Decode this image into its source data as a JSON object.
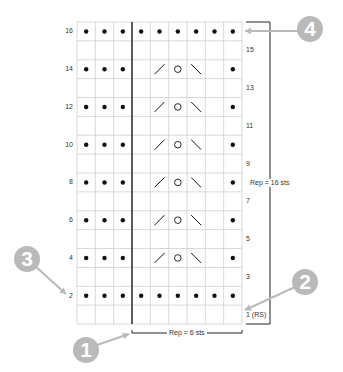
{
  "chart": {
    "columns": 9,
    "rows": 16,
    "grid_color": "#c8c8c8",
    "symbol_color": "#111111",
    "callout_color": "#b9b9b9",
    "row_pattern_key": {
      "P": "purl (dot)",
      "K": "knit (blank)",
      "/": "k2tog",
      "O": "yarn over",
      "\\": "ssk"
    },
    "rows_data": [
      {
        "row": 1,
        "side": "right",
        "label": "1 (RS)",
        "cells": [
          "K",
          "K",
          "K",
          "K",
          "K",
          "K",
          "K",
          "K",
          "K"
        ]
      },
      {
        "row": 2,
        "side": "left",
        "label": "2",
        "cells": [
          "P",
          "P",
          "P",
          "P",
          "P",
          "P",
          "P",
          "P",
          "P"
        ]
      },
      {
        "row": 3,
        "side": "right",
        "label": "3",
        "cells": [
          "K",
          "K",
          "K",
          "K",
          "K",
          "K",
          "K",
          "K",
          "K"
        ]
      },
      {
        "row": 4,
        "side": "left",
        "label": "4",
        "cells": [
          "P",
          "P",
          "P",
          "K",
          "/",
          "O",
          "\\",
          "K",
          "P"
        ]
      },
      {
        "row": 5,
        "side": "right",
        "label": "5",
        "cells": [
          "K",
          "K",
          "K",
          "K",
          "K",
          "K",
          "K",
          "K",
          "K"
        ]
      },
      {
        "row": 6,
        "side": "left",
        "label": "6",
        "cells": [
          "P",
          "P",
          "P",
          "K",
          "/",
          "O",
          "\\",
          "K",
          "P"
        ]
      },
      {
        "row": 7,
        "side": "right",
        "label": "7",
        "cells": [
          "K",
          "K",
          "K",
          "K",
          "K",
          "K",
          "K",
          "K",
          "K"
        ]
      },
      {
        "row": 8,
        "side": "left",
        "label": "8",
        "cells": [
          "P",
          "P",
          "P",
          "K",
          "/",
          "O",
          "\\",
          "K",
          "P"
        ]
      },
      {
        "row": 9,
        "side": "right",
        "label": "9",
        "cells": [
          "K",
          "K",
          "K",
          "K",
          "K",
          "K",
          "K",
          "K",
          "K"
        ]
      },
      {
        "row": 10,
        "side": "left",
        "label": "10",
        "cells": [
          "P",
          "P",
          "P",
          "K",
          "/",
          "O",
          "\\",
          "K",
          "P"
        ]
      },
      {
        "row": 11,
        "side": "right",
        "label": "11",
        "cells": [
          "K",
          "K",
          "K",
          "K",
          "K",
          "K",
          "K",
          "K",
          "K"
        ]
      },
      {
        "row": 12,
        "side": "left",
        "label": "12",
        "cells": [
          "P",
          "P",
          "P",
          "K",
          "/",
          "O",
          "\\",
          "K",
          "P"
        ]
      },
      {
        "row": 13,
        "side": "right",
        "label": "13",
        "cells": [
          "K",
          "K",
          "K",
          "K",
          "K",
          "K",
          "K",
          "K",
          "K"
        ]
      },
      {
        "row": 14,
        "side": "left",
        "label": "14",
        "cells": [
          "P",
          "P",
          "P",
          "K",
          "/",
          "O",
          "\\",
          "K",
          "P"
        ]
      },
      {
        "row": 15,
        "side": "right",
        "label": "15",
        "cells": [
          "K",
          "K",
          "K",
          "K",
          "K",
          "K",
          "K",
          "K",
          "K"
        ]
      },
      {
        "row": 16,
        "side": "left",
        "label": "16",
        "cells": [
          "P",
          "P",
          "P",
          "P",
          "P",
          "P",
          "P",
          "P",
          "P"
        ]
      }
    ],
    "repeat_horizontal": {
      "label": "Rep = 6 sts",
      "start_col": 4,
      "end_col": 9
    },
    "repeat_vertical": {
      "label": "Rep = 16 sts",
      "start_row": 1,
      "end_row": 16
    },
    "callouts": [
      {
        "number": "1",
        "points_to": "start of stitch repeat line"
      },
      {
        "number": "2",
        "points_to": "row 1 (RS) label"
      },
      {
        "number": "3",
        "points_to": "row 2 label"
      },
      {
        "number": "4",
        "points_to": "row 16 / top of row repeat"
      }
    ]
  }
}
